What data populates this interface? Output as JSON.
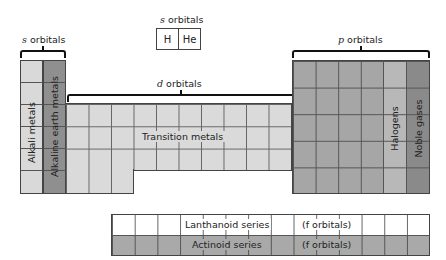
{
  "labels": {
    "s_left": {
      "italic": "s",
      "text": " orbitals"
    },
    "s_top": {
      "italic": "s",
      "text": " orbitals"
    },
    "d": {
      "italic": "d",
      "text": " orbitals"
    },
    "p": {
      "italic": "p",
      "text": " orbitals"
    }
  },
  "hydrogen_helium": [
    "H",
    "He"
  ],
  "groups": {
    "alkali": "Alkali metals",
    "alkaline_earth": "Alkaline earth metals",
    "transition": "Transition metals",
    "halogens": "Halogens",
    "noble": "Noble gases"
  },
  "f_block": {
    "lanthanoid": "Lanthanoid series",
    "actinoid": "Actinoid series",
    "f_note_1": "(f orbitals)",
    "f_note_2": "(f orbitals)"
  },
  "colors": {
    "alkali": "#d9d9d9",
    "alkaline_earth": "#8f8f8f",
    "transition": "#dadada",
    "p_block": "#a6a6a6",
    "halogens": "#b8b8b8",
    "noble": "#8a8a8a",
    "lanthanoid": "#ffffff",
    "actinoid": "#a9a9a9"
  }
}
